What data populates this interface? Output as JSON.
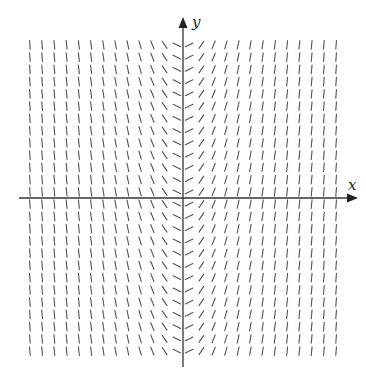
{
  "diagram": {
    "type": "slope_field",
    "axes": {
      "x_label": "x",
      "y_label": "y",
      "origin_px": [
        183,
        198
      ],
      "x_axis": {
        "from_px": 19,
        "to_px": 358
      },
      "y_axis": {
        "from_px": 367,
        "to_px": 17
      }
    },
    "grid": {
      "columns": 26,
      "rows": 26,
      "spacing_px": 12.25,
      "offset": "half-spacing from axes",
      "segment_length_px": 8.5
    },
    "slope_rule": "slope = k * x_grid, constant along each column",
    "slope_k": 1.0,
    "colors": {
      "axis": "#333333",
      "segment": "#555555",
      "background": "#ffffff"
    }
  }
}
